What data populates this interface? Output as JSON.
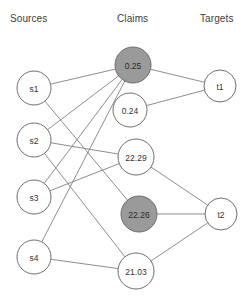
{
  "figure": {
    "title": "",
    "background": "#ffffff",
    "edge_color": "#808080",
    "node_stroke": "#6e6e6e",
    "node_fill_plain": "#ffffff",
    "node_fill_highlight": "#9a9a9a",
    "text_color": "#3c3c3c"
  },
  "columns": [
    {
      "key": "sources",
      "label": "Sources",
      "x": 24,
      "header_x": 10,
      "header_y": 22
    },
    {
      "key": "claims",
      "label": "Claims",
      "x": 140,
      "header_x": 117,
      "header_y": 22
    },
    {
      "key": "targets",
      "label": "Targets",
      "x": 220,
      "header_x": 200,
      "header_y": 22
    }
  ],
  "nodes": {
    "sources": [
      {
        "id": "s1",
        "label": "s1",
        "x": 34,
        "y": 88,
        "r": 17,
        "style": "plain"
      },
      {
        "id": "s2",
        "label": "s2",
        "x": 34,
        "y": 140,
        "r": 17,
        "style": "plain"
      },
      {
        "id": "s3",
        "label": "s3",
        "x": 34,
        "y": 197,
        "r": 17,
        "style": "plain"
      },
      {
        "id": "s4",
        "label": "s4",
        "x": 34,
        "y": 257,
        "r": 17,
        "style": "plain"
      }
    ],
    "claims": [
      {
        "id": "c1",
        "label": "0.25",
        "x": 133,
        "y": 65,
        "r": 18,
        "style": "highlight"
      },
      {
        "id": "c2",
        "label": "0.24",
        "x": 130,
        "y": 110,
        "r": 17,
        "style": "plain"
      },
      {
        "id": "c3",
        "label": "22.29",
        "x": 136,
        "y": 157,
        "r": 18,
        "style": "plain"
      },
      {
        "id": "c4",
        "label": "22.26",
        "x": 139,
        "y": 214,
        "r": 18,
        "style": "highlight"
      },
      {
        "id": "c5",
        "label": "21.03",
        "x": 136,
        "y": 271,
        "r": 18,
        "style": "plain"
      }
    ],
    "targets": [
      {
        "id": "t1",
        "label": "t1",
        "x": 220,
        "y": 86,
        "r": 16,
        "style": "plain"
      },
      {
        "id": "t2",
        "label": "t2",
        "x": 221,
        "y": 214,
        "r": 16,
        "style": "plain"
      }
    ]
  },
  "edges": [
    {
      "from": "s1",
      "to": "c1"
    },
    {
      "from": "s1",
      "to": "c4"
    },
    {
      "from": "s2",
      "to": "c1"
    },
    {
      "from": "s2",
      "to": "c3"
    },
    {
      "from": "s2",
      "to": "c5"
    },
    {
      "from": "s3",
      "to": "c1"
    },
    {
      "from": "s3",
      "to": "c3"
    },
    {
      "from": "s4",
      "to": "c1"
    },
    {
      "from": "s4",
      "to": "c5"
    },
    {
      "from": "c1",
      "to": "t1"
    },
    {
      "from": "c2",
      "to": "t1"
    },
    {
      "from": "c3",
      "to": "t2"
    },
    {
      "from": "c4",
      "to": "t2"
    },
    {
      "from": "c5",
      "to": "t2"
    }
  ],
  "chart_data": {
    "type": "diagram",
    "diagram_type": "tripartite-graph",
    "title": "",
    "column_labels": [
      "Sources",
      "Claims",
      "Targets"
    ],
    "source_nodes": [
      "s1",
      "s2",
      "s3",
      "s4"
    ],
    "claim_nodes": [
      "0.25",
      "0.24",
      "22.29",
      "22.26",
      "21.03"
    ],
    "claim_values": [
      0.25,
      0.24,
      22.29,
      22.26,
      21.03
    ],
    "claim_highlighted": [
      "0.25",
      "22.26"
    ],
    "target_nodes": [
      "t1",
      "t2"
    ],
    "links": [
      [
        "s1",
        "0.25"
      ],
      [
        "s1",
        "22.26"
      ],
      [
        "s2",
        "0.25"
      ],
      [
        "s2",
        "22.29"
      ],
      [
        "s2",
        "21.03"
      ],
      [
        "s3",
        "0.25"
      ],
      [
        "s3",
        "22.29"
      ],
      [
        "s4",
        "0.25"
      ],
      [
        "s4",
        "21.03"
      ],
      [
        "0.25",
        "t1"
      ],
      [
        "0.24",
        "t1"
      ],
      [
        "22.29",
        "t2"
      ],
      [
        "22.26",
        "t2"
      ],
      [
        "21.03",
        "t2"
      ]
    ],
    "legend": [],
    "grid": false
  }
}
